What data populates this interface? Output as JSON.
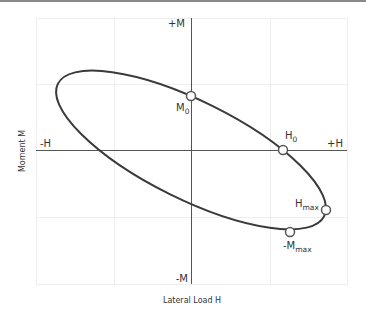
{
  "diagram": {
    "x_axis_title": "Lateral Load H",
    "y_axis_title": "Moment M",
    "axis_labels": {
      "pos_m": "+M",
      "neg_m": "-M",
      "pos_h": "+H",
      "neg_h": "-H"
    },
    "points": [
      {
        "id": "m0",
        "label": "M",
        "sub": "0"
      },
      {
        "id": "h0",
        "label": "H",
        "sub": "0"
      },
      {
        "id": "hmax",
        "label": "H",
        "sub": "max"
      },
      {
        "id": "neg-mmax",
        "label": "-M",
        "sub": "max"
      }
    ],
    "colors": {
      "curve": "#3a3a3a",
      "axis": "#555555",
      "grid": "#ececec",
      "marker_fill": "#ffffff",
      "marker_stroke": "#555555"
    }
  }
}
